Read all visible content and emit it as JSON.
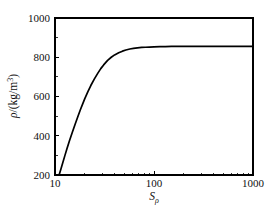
{
  "chart_data": {
    "type": "line",
    "title": "",
    "subtitle": "",
    "xlabel": "S_rho",
    "xlabel_base": "S",
    "xlabel_sub": "ρ",
    "ylabel": "ρ/(kg/m³)",
    "ylabel_symbol": "ρ",
    "ylabel_rest": "/(kg/m",
    "ylabel_exp": "3",
    "ylabel_close": ")",
    "xscale": "log",
    "yscale": "linear",
    "xlim": [
      10,
      1000
    ],
    "ylim": [
      200,
      1000
    ],
    "grid": false,
    "legend": false,
    "xticks": [
      10,
      100,
      1000
    ],
    "xtick_labels": [
      "10",
      "100",
      "1000"
    ],
    "yticks": [
      200,
      400,
      600,
      800,
      1000
    ],
    "ytick_labels": [
      "200",
      "400",
      "600",
      "800",
      "1000"
    ],
    "yticks_minor": [
      300,
      500,
      700,
      900
    ],
    "plateau_value": 855,
    "line_color": "#000000",
    "axis_color": "#000000",
    "background_color": "#ffffff",
    "series": [
      {
        "name": "density",
        "x": [
          11.0,
          11.5,
          12.0,
          12.6,
          13.2,
          14.0,
          15.0,
          16.0,
          17.0,
          18.0,
          19.0,
          20.0,
          21.5,
          23.0,
          25.0,
          27.0,
          29.0,
          31.0,
          34.0,
          37.0,
          40.0,
          44.0,
          48.0,
          52.0,
          57.0,
          62.0,
          68.0,
          75.0,
          82.0,
          90.0,
          100.0,
          115.0,
          130.0,
          150.0,
          180.0,
          220.0,
          280.0,
          360.0,
          480.0,
          650.0,
          850.0,
          1000.0
        ],
        "y": [
          200,
          232,
          264,
          300,
          334,
          374,
          419,
          460,
          497,
          531,
          561,
          589,
          625,
          656,
          690,
          718,
          742,
          761,
          784,
          800,
          812,
          823,
          831,
          837,
          842,
          845,
          848,
          850,
          851,
          852,
          853,
          854,
          854,
          855,
          855,
          855,
          855,
          855,
          855,
          855,
          855,
          855
        ]
      }
    ]
  },
  "axes_geometry": {
    "left_px": 55,
    "right_px": 253,
    "top_px": 18,
    "bottom_px": 175
  }
}
